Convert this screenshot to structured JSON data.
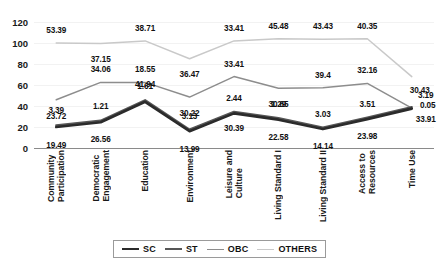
{
  "chart_data": {
    "type": "line",
    "title": "",
    "xlabel": "",
    "ylabel": "",
    "ylim": [
      0,
      120
    ],
    "yticks": [
      0,
      20,
      40,
      60,
      80,
      100,
      120
    ],
    "grid": true,
    "legend_position": "bottom",
    "categories": [
      "Community Participation",
      "Democratic Engagement",
      "Education",
      "Environment",
      "Leisure and Culture",
      "Living Standard I",
      "Living Standard II",
      "Access to Resources",
      "Time Use"
    ],
    "category_lines": [
      [
        "Community",
        "Participation"
      ],
      [
        "Democratic",
        "Engagement"
      ],
      [
        "Education"
      ],
      [
        "Environment"
      ],
      [
        "Leisure and",
        "Culture"
      ],
      [
        "Living Standard I"
      ],
      [
        "Living Standard II"
      ],
      [
        "Access to",
        "Resources"
      ],
      [
        "Time Use"
      ]
    ],
    "series": [
      {
        "name": "SC",
        "color": "#2b2b2b",
        "width": 2.6,
        "values": [
          19.49,
          26.56,
          41.94,
          13.99,
          30.39,
          22.58,
          14.14,
          23.98,
          33.91
        ],
        "labels": [
          "19.49",
          "26.56",
          "41.94",
          "13.99",
          "30.39",
          "22.58",
          "14.14",
          "23.98",
          "33.91"
        ]
      },
      {
        "name": "ST",
        "color": "#565656",
        "width": 2.2,
        "values": [
          3.39,
          1.21,
          1.61,
          3.13,
          2.44,
          1.29,
          3.03,
          3.51,
          0.05
        ],
        "labels": [
          "3.39",
          "1.21",
          "1.61",
          "3.13",
          "2.44",
          "1.29",
          "3.03",
          "3.51",
          "0.05"
        ]
      },
      {
        "name": "OBC",
        "color": "#8d8d8d",
        "width": 1.5,
        "values": [
          23.72,
          34.06,
          18.55,
          30.22,
          33.41,
          30.65,
          39.4,
          32.16,
          3.19
        ],
        "labels": [
          "23.72",
          "34.06",
          "18.55",
          "30.22",
          "33.41",
          "30.65",
          "39.4",
          "32.16",
          "3.19"
        ]
      },
      {
        "name": "OTHERS",
        "color": "#c9c9c9",
        "width": 1.5,
        "values": [
          53.39,
          37.15,
          38.71,
          36.47,
          33.41,
          45.48,
          43.43,
          40.35,
          30.43
        ],
        "labels": [
          "53.39",
          "37.15",
          "38.71",
          "36.47",
          "33.41",
          "45.48",
          "43.43",
          "40.35",
          "30.43"
        ]
      }
    ],
    "plotted_points": {
      "SC": [
        20.0,
        24.5,
        44.0,
        16.0,
        33.0,
        27.0,
        18.0,
        27.5,
        37.5
      ],
      "ST": [
        21.5,
        26.0,
        45.5,
        17.5,
        34.5,
        28.5,
        19.5,
        29.0,
        39.0
      ],
      "OBC": [
        46.0,
        62.5,
        62.5,
        48.5,
        68.0,
        57.0,
        57.5,
        61.5,
        38.0
      ],
      "OTHERS": [
        100.0,
        99.5,
        102.0,
        85.0,
        102.0,
        104.0,
        103.5,
        104.0,
        68.0
      ]
    },
    "label_offsets": {
      "SC": [
        [
          0,
          18
        ],
        [
          0,
          17
        ],
        [
          0,
          -18
        ],
        [
          0,
          18
        ],
        [
          0,
          15
        ],
        [
          0,
          17
        ],
        [
          0,
          17
        ],
        [
          0,
          17
        ],
        [
          14,
          10
        ]
      ],
      "ST": [
        [
          0,
          -15
        ],
        [
          0,
          -15
        ],
        [
          0,
          -14
        ],
        [
          0,
          -14
        ],
        [
          0,
          -14
        ],
        [
          0,
          -14
        ],
        [
          0,
          -14
        ],
        [
          0,
          -14
        ],
        [
          16,
          -2
        ]
      ],
      "OBC": [
        [
          0,
          16
        ],
        [
          0,
          -13
        ],
        [
          0,
          -13
        ],
        [
          0,
          16
        ],
        [
          0,
          -13
        ],
        [
          0,
          16
        ],
        [
          0,
          -13
        ],
        [
          0,
          -13
        ],
        [
          14,
          -13
        ]
      ],
      "OTHERS": [
        [
          0,
          -13
        ],
        [
          0,
          15
        ],
        [
          0,
          -13
        ],
        [
          0,
          15
        ],
        [
          0,
          -13
        ],
        [
          0,
          -13
        ],
        [
          0,
          -13
        ],
        [
          0,
          -13
        ],
        [
          8,
          13
        ]
      ]
    }
  },
  "legend": {
    "items": [
      {
        "label": "SC",
        "color": "#2b2b2b",
        "width": 2.6
      },
      {
        "label": "ST",
        "color": "#565656",
        "width": 2.2
      },
      {
        "label": "OBC",
        "color": "#8d8d8d",
        "width": 1.5
      },
      {
        "label": "OTHERS",
        "color": "#c9c9c9",
        "width": 1.5
      }
    ]
  }
}
